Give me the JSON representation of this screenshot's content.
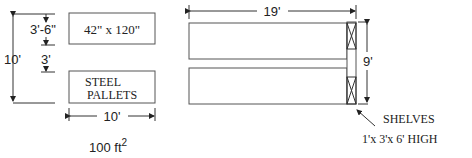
{
  "left_diagram": {
    "top_box_label": "42\" x 120\"",
    "bottom_box_label_line1": "STEEL",
    "bottom_box_label_line2": "PALLETS",
    "dim_height": "10'",
    "dim_top_gap": "3'-6\"",
    "dim_mid_gap": "3'",
    "dim_width": "10'",
    "area_value": "100  ft",
    "area_exponent": "2"
  },
  "right_diagram": {
    "dim_length": "19'",
    "dim_height": "9'",
    "shelves_label": "SHELVES",
    "shelves_size": "1'x 3'x 6'  HIGH"
  }
}
